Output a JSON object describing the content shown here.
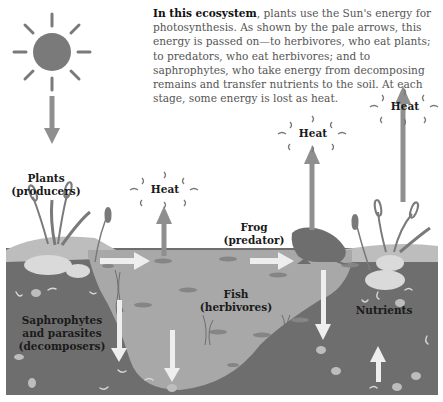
{
  "diagram": {
    "title_bold": "In this ecosystem",
    "caption_rest": ", plants use the Sun's energy for photosynthesis. As shown by the pale arrows, this energy is passed on—to herbivores, who eat plants; to predators, who eat herbivores; and to saphrophytes, who take energy from decomposing remains and transfer nutrients to the soil. At each stage, some energy is lost as heat.",
    "labels": {
      "plants": "Plants",
      "plants_role": "(producers)",
      "frog": "Frog",
      "frog_role": "(predator)",
      "fish": "Fish",
      "fish_role": "(herbivores)",
      "decomposers_1": "Saphrophytes",
      "decomposers_2": "and parasites",
      "decomposers_3": "(decomposers)",
      "nutrients": "Nutrients",
      "heat_1": "Heat",
      "heat_2": "Heat",
      "heat_3": "Heat"
    },
    "icons": [
      "sun-icon",
      "heat-wave-icon",
      "frog-icon",
      "fish-icon",
      "cattail-plant-icon",
      "energy-arrow-icon"
    ],
    "colors": {
      "sky": "#ffffff",
      "water": "#a8a8a8",
      "soil": "#6e6e6e",
      "bank": "#bdbdbd",
      "rock": "#dadada",
      "sun": "#7a7a7a",
      "energy_arrow": "#eeeeee",
      "heat_arrow": "#8f8f8f"
    }
  }
}
